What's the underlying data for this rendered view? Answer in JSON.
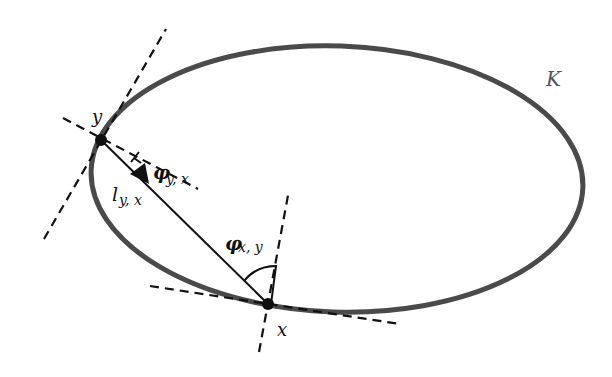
{
  "diagram": {
    "curve": {
      "label": "K",
      "color": "#4a4a4a"
    },
    "points": {
      "y": {
        "label": "y"
      },
      "x": {
        "label": "x"
      }
    },
    "segment": {
      "label_main": "l",
      "label_sub": "y, x"
    },
    "angles": {
      "phi_yx": {
        "main": "φ",
        "sub": "y, x"
      },
      "phi_xy": {
        "main": "φ",
        "sub": "x, y"
      }
    },
    "colors": {
      "curve": "#4a4a4a",
      "lines": "#111111",
      "background": "#ffffff"
    }
  }
}
